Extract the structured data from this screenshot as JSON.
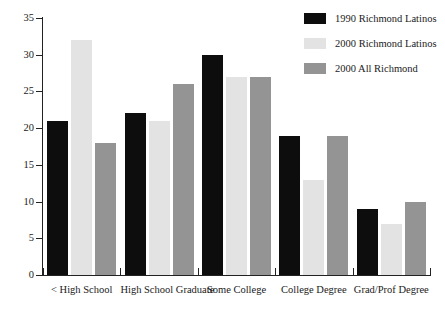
{
  "chart_data": {
    "type": "bar",
    "title": "",
    "subtitle": "",
    "xlabel": "",
    "ylabel": "",
    "ylim": [
      0,
      35
    ],
    "yticks": [
      0,
      5,
      10,
      15,
      20,
      25,
      30,
      35
    ],
    "ytick_labels": [
      "0",
      "5",
      "10",
      "15",
      "20",
      "25",
      "30",
      "35"
    ],
    "grid": false,
    "legend_position": "top-right",
    "categories": [
      "< High School",
      "High School Graduate",
      "Some College",
      "College Degree",
      "Grad/Prof Degree"
    ],
    "series": [
      {
        "name": "1990 Richmond Latinos",
        "color": "#0d0d0d",
        "values": [
          21,
          22,
          30,
          19,
          9
        ]
      },
      {
        "name": "2000 Richmond Latinos",
        "color": "#e3e3e3",
        "values": [
          32,
          21,
          27,
          13,
          7
        ]
      },
      {
        "name": "2000 All Richmond",
        "color": "#949494",
        "values": [
          18,
          26,
          27,
          19,
          10
        ]
      }
    ]
  },
  "legend": {
    "items": [
      {
        "label": "1990 Richmond Latinos",
        "color": "#0d0d0d"
      },
      {
        "label": "2000 Richmond Latinos",
        "color": "#e3e3e3"
      },
      {
        "label": "2000 All Richmond",
        "color": "#949494"
      }
    ]
  },
  "axes": {
    "y_tick_labels": [
      "0",
      "5",
      "10",
      "15",
      "20",
      "25",
      "30",
      "35"
    ],
    "x_category_labels": [
      "< High School",
      "High School Graduate",
      "Some College",
      "College Degree",
      "Grad/Prof Degree"
    ]
  }
}
